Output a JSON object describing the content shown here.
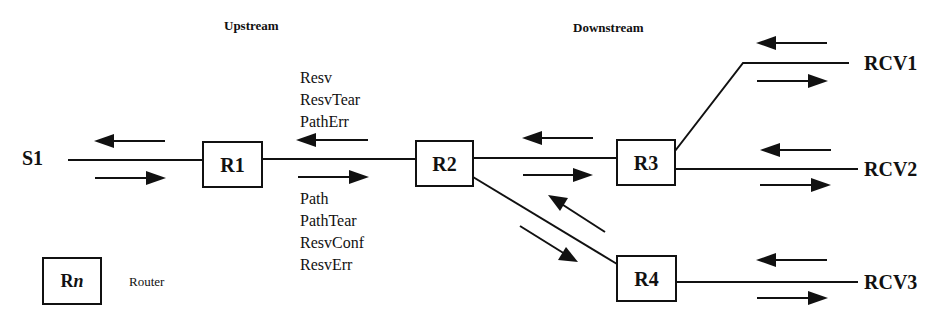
{
  "headers": {
    "upstream": "Upstream",
    "downstream": "Downstream"
  },
  "nodes": {
    "source": "S1",
    "routers": [
      "R1",
      "R2",
      "R3",
      "R4"
    ],
    "receivers": [
      "RCV1",
      "RCV2",
      "RCV3"
    ]
  },
  "messages": {
    "upstream": [
      "Resv",
      "ResvTear",
      "PathErr"
    ],
    "downstream": [
      "Path",
      "PathTear",
      "ResvConf",
      "ResvErr"
    ]
  },
  "legend": {
    "symbol_prefix": "R",
    "symbol_suffix": "n",
    "label": "Router"
  },
  "colors": {
    "ink": "#111111",
    "background": "#ffffff"
  }
}
